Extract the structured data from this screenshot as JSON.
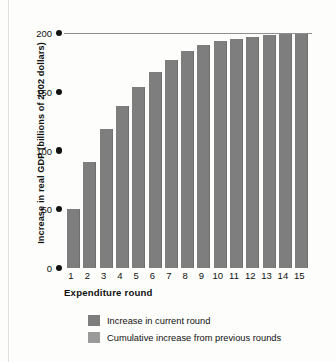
{
  "chart_data": {
    "type": "bar",
    "title": "",
    "xlabel": "Expenditure round",
    "ylabel": "Increase in real GDP (billions of 2002 dollars)",
    "categories": [
      "1",
      "2",
      "3",
      "4",
      "5",
      "6",
      "7",
      "8",
      "9",
      "10",
      "11",
      "12",
      "13",
      "14",
      "15"
    ],
    "values": [
      50,
      90,
      118,
      138,
      154,
      167,
      177,
      185,
      190,
      193,
      195,
      197,
      198,
      199,
      199.5
    ],
    "ylim": [
      0,
      200
    ],
    "yticks": [
      0,
      50,
      100,
      150,
      200
    ],
    "ytick_labels": [
      "0",
      "50",
      "100",
      "150",
      "200"
    ],
    "grid": "single horizontal rule at 200",
    "legend_position": "below-axis-left",
    "series": [
      {
        "name": "Increase in current round",
        "color": "#7e7e7e"
      },
      {
        "name": "Cumulative increase from previous rounds",
        "color": "#9a9a9a"
      }
    ],
    "bar_color": "#7e7e7e"
  },
  "axis": {
    "y_title": "Increase in real GDP (billions of 2002 dollars)",
    "x_title": "Expenditure round"
  },
  "legend": {
    "items": [
      {
        "label": "Increase in current round",
        "color": "#7e7e7e"
      },
      {
        "label": "Cumulative increase from previous rounds",
        "color": "#9a9a9a"
      }
    ]
  },
  "colors": {
    "bar": "#7e7e7e",
    "gridline": "#8f8f8f",
    "text": "#111111",
    "background": "#fdfdfb"
  }
}
